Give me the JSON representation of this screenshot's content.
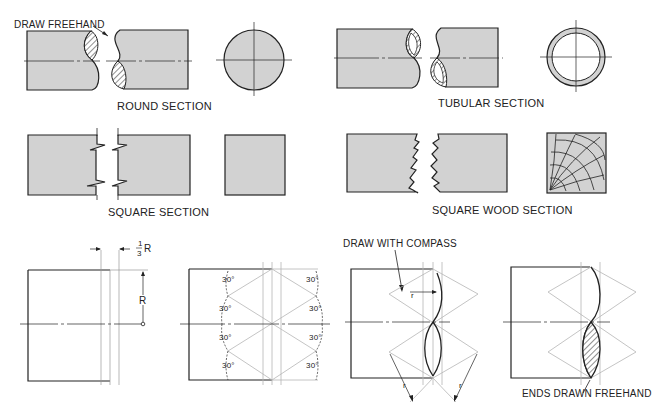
{
  "figure": {
    "colors": {
      "fill": "#d2d2d2",
      "line": "#222222",
      "construction": "#b5b5b5",
      "background": "#ffffff"
    },
    "labels": {
      "draw_freehand": "DRAW FREEHAND",
      "round_section": "ROUND SECTION",
      "tubular_section": "TUBULAR SECTION",
      "square_section": "SQUARE SECTION",
      "square_wood_section": "SQUARE WOOD SECTION",
      "draw_with_compass": "DRAW WITH COMPASS",
      "ends_drawn_freehand": "ENDS DRAWN FREEHAND"
    },
    "construction": {
      "one_third_num": "1",
      "one_third_den": "3",
      "one_third_R": "R",
      "radius_R": "R",
      "angles": [
        "30°",
        "30°",
        "30°",
        "30°",
        "30°",
        "30°",
        "30°",
        "30°"
      ],
      "compass_r": [
        "r",
        "r",
        "r"
      ]
    }
  }
}
